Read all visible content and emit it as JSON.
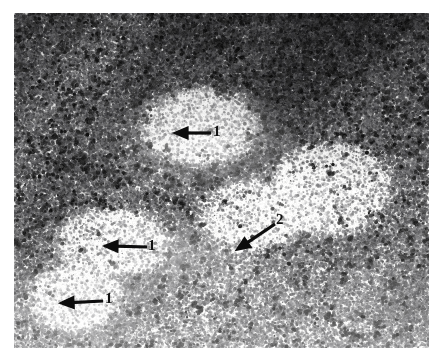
{
  "figure": {
    "kind": "histology-micrograph",
    "plate": {
      "left": 14,
      "top": 13,
      "width": 415,
      "height": 335,
      "background_color": "#fbfbfa",
      "grain_color": "#1a1a1a",
      "paper_color": "#ffffff"
    },
    "annotations": [
      {
        "id": "arrow-1-upper",
        "label": "1",
        "direction": "left",
        "tail_x": 211,
        "tail_y": 133,
        "head_x": 176,
        "head_y": 133,
        "label_x": 213,
        "label_y": 124
      },
      {
        "id": "arrow-1-middle",
        "label": "1",
        "direction": "left",
        "tail_x": 147,
        "tail_y": 247,
        "head_x": 106,
        "head_y": 246,
        "label_x": 148,
        "label_y": 238
      },
      {
        "id": "arrow-2-centre",
        "label": "2",
        "direction": "down-left",
        "tail_x": 275,
        "tail_y": 224,
        "head_x": 238,
        "head_y": 249,
        "label_x": 276,
        "label_y": 212
      },
      {
        "id": "arrow-1-lower",
        "label": "1",
        "direction": "left",
        "tail_x": 103,
        "tail_y": 301,
        "head_x": 62,
        "head_y": 303,
        "label_x": 105,
        "label_y": 291
      }
    ],
    "pale_regions": [
      {
        "name": "germinal-centre-upper",
        "cx": 200,
        "cy": 127,
        "rx": 52,
        "ry": 33
      },
      {
        "name": "germinal-centre-middle-left",
        "cx": 112,
        "cy": 243,
        "rx": 50,
        "ry": 30
      },
      {
        "name": "germinal-centre-lower-left",
        "cx": 76,
        "cy": 297,
        "rx": 40,
        "ry": 28
      },
      {
        "name": "pale-zone-centre",
        "cx": 250,
        "cy": 215,
        "rx": 46,
        "ry": 30
      },
      {
        "name": "pale-zone-right",
        "cx": 330,
        "cy": 190,
        "rx": 54,
        "ry": 40
      }
    ]
  }
}
